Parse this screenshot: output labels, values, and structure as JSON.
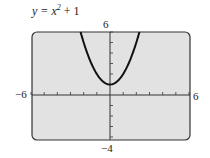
{
  "chart_data": {
    "type": "line",
    "function": "y = x^2 + 1",
    "xlabel": "",
    "ylabel": "",
    "xlim": [
      -6,
      6
    ],
    "ylim": [
      -4,
      6
    ],
    "xtick_step": 1,
    "ytick_step": 1,
    "grid": false,
    "axis_labels": {
      "xmin": "−6",
      "xmax": "6",
      "ymin": "−4",
      "ymax": "6"
    },
    "series": [
      {
        "name": "y = x^2 + 1",
        "x": [
          -2.236,
          -2,
          -1.5,
          -1,
          -0.5,
          0,
          0.5,
          1,
          1.5,
          2,
          2.236
        ],
        "y": [
          6,
          5,
          3.25,
          2,
          1.25,
          1,
          1.25,
          2,
          3.25,
          5,
          6
        ]
      }
    ],
    "colors": {
      "panel": "#e2e2e2",
      "border": "#333333",
      "curve": "#111111"
    }
  },
  "title": {
    "var": "y = x",
    "exp": "2",
    "rest": " + 1"
  },
  "labels": {
    "xmin": "−6",
    "xmax": "6",
    "ymin": "−4",
    "ymax": "6"
  }
}
